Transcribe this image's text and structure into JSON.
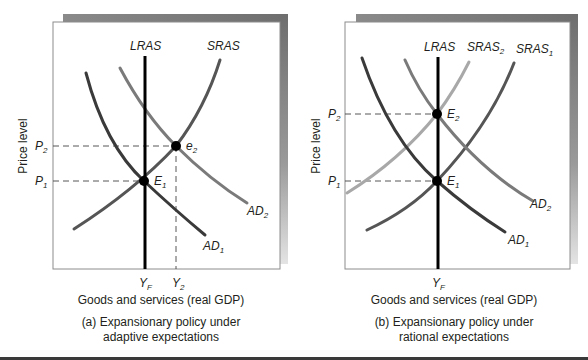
{
  "panels": [
    {
      "id": "a",
      "caption_line1": "(a) Expansionary policy under",
      "caption_line2": "adaptive expectations",
      "y_axis_label": "Price level",
      "x_axis_label": "Goods and services (real GDP)",
      "price_ticks": [
        {
          "base": "P",
          "sub": "2"
        },
        {
          "base": "P",
          "sub": "1"
        }
      ],
      "output_ticks": [
        {
          "base": "Y",
          "sub": "F"
        },
        {
          "base": "Y",
          "sub": "2"
        }
      ],
      "curve_labels": {
        "lras": "LRAS",
        "sras": "SRAS",
        "ad1": {
          "base": "AD",
          "sub": "1"
        },
        "ad2": {
          "base": "AD",
          "sub": "2"
        }
      },
      "points": {
        "e1": {
          "base": "E",
          "sub": "1"
        },
        "e2": {
          "base": "e",
          "sub": "2"
        }
      }
    },
    {
      "id": "b",
      "caption_line1": "(b) Expansionary policy under",
      "caption_line2": "rational expectations",
      "y_axis_label": "Price level",
      "x_axis_label": "Goods and services (real GDP)",
      "price_ticks": [
        {
          "base": "P",
          "sub": "2"
        },
        {
          "base": "P",
          "sub": "1"
        }
      ],
      "output_ticks": [
        {
          "base": "Y",
          "sub": "F"
        }
      ],
      "curve_labels": {
        "lras": "LRAS",
        "sras2": {
          "base": "SRAS",
          "sub": "2"
        },
        "sras1": {
          "base": "SRAS",
          "sub": "1"
        },
        "ad1": {
          "base": "AD",
          "sub": "1"
        },
        "ad2": {
          "base": "AD",
          "sub": "2"
        }
      },
      "points": {
        "e1": {
          "base": "E",
          "sub": "1"
        },
        "e2": {
          "base": "E",
          "sub": "2"
        }
      }
    }
  ],
  "colors": {
    "lras": "#000000",
    "ad1": "#3a3a3a",
    "sras1": "#555555",
    "ad2": "#7a7a7a",
    "sras2": "#a8a8a8",
    "frame_shadow": "#7d7d7d",
    "dashed": "#444444"
  }
}
